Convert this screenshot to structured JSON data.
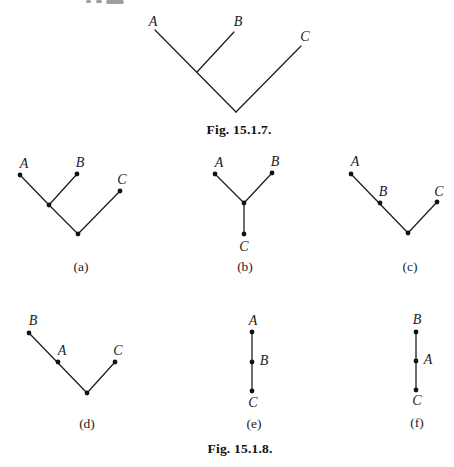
{
  "page": {
    "background": "#ffffff",
    "ink_color": "#1c1c1c"
  },
  "fig_15_1_7": {
    "caption": "Fig. 15.1.7.",
    "nodes": {
      "A": "A",
      "B": "B",
      "C": "C"
    }
  },
  "fig_15_1_8": {
    "caption": "Fig. 15.1.8.",
    "panels": [
      {
        "tag": "(a)",
        "nodes": {
          "A": "A",
          "B": "B",
          "C": "C"
        }
      },
      {
        "tag": "(b)",
        "nodes": {
          "A": "A",
          "B": "B",
          "C": "C"
        }
      },
      {
        "tag": "(c)",
        "nodes": {
          "A": "A",
          "B": "B",
          "C": "C"
        }
      },
      {
        "tag": "(d)",
        "nodes": {
          "A": "A",
          "B": "B",
          "C": "C"
        }
      },
      {
        "tag": "(e)",
        "nodes": {
          "A": "A",
          "B": "B",
          "C": "C"
        }
      },
      {
        "tag": "(f)",
        "nodes": {
          "A": "A",
          "B": "B",
          "C": "C"
        }
      }
    ]
  }
}
